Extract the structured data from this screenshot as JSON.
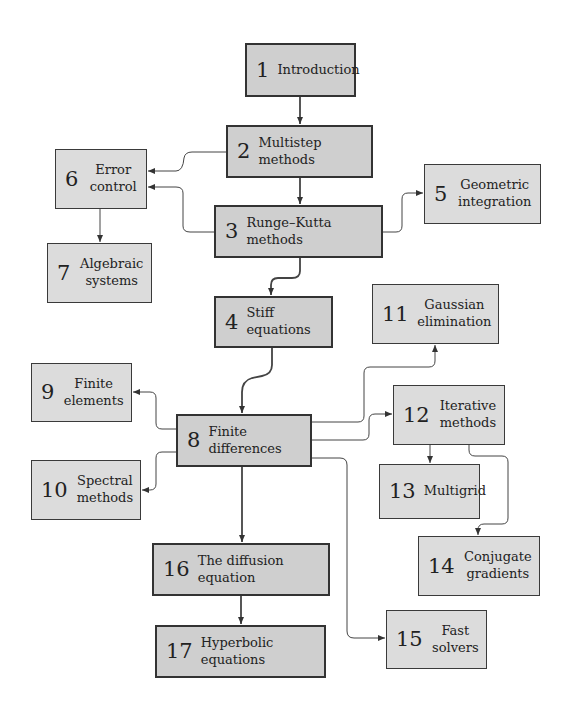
{
  "diagram": {
    "nodes": [
      {
        "id": "1",
        "num": "1",
        "label": "Introduction",
        "main": true
      },
      {
        "id": "2",
        "num": "2",
        "label": "Multistep methods",
        "main": true
      },
      {
        "id": "3",
        "num": "3",
        "label": "Runge–Kutta methods",
        "main": true
      },
      {
        "id": "4",
        "num": "4",
        "label": "Stiff equations",
        "main": true
      },
      {
        "id": "5",
        "num": "5",
        "label": "Geometric integration",
        "main": false
      },
      {
        "id": "6",
        "num": "6",
        "label": "Error control",
        "main": false
      },
      {
        "id": "7",
        "num": "7",
        "label": "Algebraic systems",
        "main": false
      },
      {
        "id": "8",
        "num": "8",
        "label": "Finite differences",
        "main": true
      },
      {
        "id": "9",
        "num": "9",
        "label": "Finite elements",
        "main": false
      },
      {
        "id": "10",
        "num": "10",
        "label": "Spectral methods",
        "main": false
      },
      {
        "id": "11",
        "num": "11",
        "label": "Gaussian elimination",
        "main": false
      },
      {
        "id": "12",
        "num": "12",
        "label": "Iterative methods",
        "main": false
      },
      {
        "id": "13",
        "num": "13",
        "label": "Multigrid",
        "main": false
      },
      {
        "id": "14",
        "num": "14",
        "label": "Conjugate gradients",
        "main": false
      },
      {
        "id": "15",
        "num": "15",
        "label": "Fast solvers",
        "main": false
      },
      {
        "id": "16",
        "num": "16",
        "label": "The diffusion equation",
        "main": true
      },
      {
        "id": "17",
        "num": "17",
        "label": "Hyperbolic equations",
        "main": true
      }
    ],
    "edges": [
      [
        "1",
        "2"
      ],
      [
        "2",
        "3"
      ],
      [
        "2",
        "6"
      ],
      [
        "3",
        "6"
      ],
      [
        "3",
        "5"
      ],
      [
        "3",
        "4"
      ],
      [
        "6",
        "7"
      ],
      [
        "4",
        "8"
      ],
      [
        "8",
        "9"
      ],
      [
        "8",
        "10"
      ],
      [
        "8",
        "11"
      ],
      [
        "8",
        "12"
      ],
      [
        "8",
        "15"
      ],
      [
        "8",
        "16"
      ],
      [
        "12",
        "13"
      ],
      [
        "12",
        "14"
      ],
      [
        "16",
        "17"
      ]
    ]
  }
}
